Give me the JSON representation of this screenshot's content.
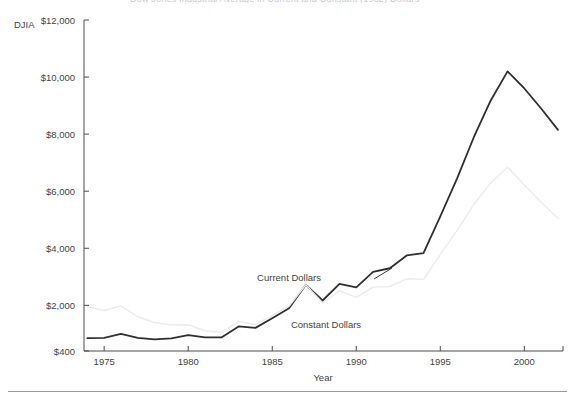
{
  "figure": {
    "name": "djia-current-vs-constant-dollars",
    "clipped_title": "Dow Jones Industrial Average in Current and Constant (1982) Dollars",
    "corner_label": "DJIA"
  },
  "chart_data": {
    "type": "line",
    "title": "Dow Jones Industrial Average in Current and Constant (1982) Dollars",
    "xlabel": "Year",
    "ylabel": "DJIA",
    "xlim": [
      1973.8,
      2002.3
    ],
    "ylim": [
      400,
      12000
    ],
    "grid": false,
    "legend": "inline-annotations",
    "xticks": [
      1975,
      1980,
      1985,
      1990,
      1995,
      2000
    ],
    "xticklabels": [
      "1975",
      "1980",
      "1985",
      "1990",
      "1995",
      "2000"
    ],
    "yticks": [
      400,
      2000,
      4000,
      6000,
      8000,
      10000,
      12000
    ],
    "yticklabels": [
      "$400",
      "$2,000",
      "$4,000",
      "$6,000",
      "$8,000",
      "$10,000",
      "$12,000"
    ],
    "x": [
      1974,
      1975,
      1976,
      1977,
      1978,
      1979,
      1980,
      1981,
      1982,
      1983,
      1984,
      1985,
      1986,
      1987,
      1988,
      1989,
      1990,
      1991,
      1992,
      1993,
      1994,
      1995,
      1996,
      1997,
      1998,
      1999,
      2000,
      2001,
      2002
    ],
    "series": [
      {
        "name": "Current Dollars",
        "color": "#2f2f2f",
        "width": 1.8,
        "values": [
          850,
          860,
          1000,
          860,
          810,
          840,
          960,
          880,
          880,
          1260,
          1210,
          1550,
          1900,
          2720,
          2170,
          2750,
          2630,
          3170,
          3300,
          3750,
          3830,
          5120,
          6450,
          7900,
          9180,
          10200,
          9600,
          8900,
          8150
        ]
      },
      {
        "name": "Constant Dollars",
        "color": "#ebebee",
        "width": 1.4,
        "values": [
          1950,
          1820,
          1980,
          1600,
          1400,
          1310,
          1320,
          1110,
          1050,
          1440,
          1330,
          1640,
          1970,
          2720,
          2080,
          2510,
          2280,
          2640,
          2660,
          2930,
          2910,
          3790,
          4630,
          5540,
          6290,
          6840,
          6220,
          5610,
          5050
        ]
      }
    ],
    "annotations": [
      {
        "text": "Current Dollars",
        "x": 1986.0,
        "y": 2850,
        "name": "current-dollars-annotation"
      },
      {
        "text": "Constant Dollars",
        "x": 1988.2,
        "y": 1200,
        "name": "constant-dollars-annotation"
      }
    ]
  }
}
